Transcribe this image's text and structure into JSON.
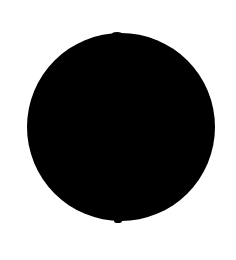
{
  "image": {
    "kind": "raster-graphic",
    "subject": "solid black circle on white background",
    "width": 236,
    "height": 260,
    "background_color": "#ffffff",
    "caption": ""
  },
  "shape": {
    "name": "circle",
    "type": "ellipse",
    "fill_color": "#000000",
    "stroke_color": "none",
    "stroke_width": 0,
    "center_x": 121,
    "center_y": 127,
    "radius_x": 94,
    "radius_y": 94,
    "diameter": 188,
    "left_edge": 27,
    "right_edge": 215,
    "top_edge": 33,
    "bottom_edge": 221,
    "edge_softness_px": 1.2
  },
  "artifacts": [
    {
      "name": "bottom-nub",
      "center_x": 118,
      "center_y": 221,
      "radius_x": 4,
      "radius_y": 2,
      "fill_color": "#000000"
    },
    {
      "name": "top-bump",
      "center_x": 117,
      "center_y": 34,
      "radius_x": 5,
      "radius_y": 2,
      "fill_color": "#000000"
    }
  ]
}
